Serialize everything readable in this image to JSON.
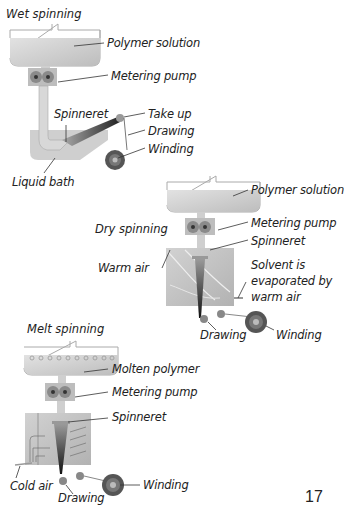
{
  "page_number": "17",
  "colors": {
    "tank_fill": "#d4d4d4",
    "chamber_fill": "#c4c4c4",
    "fiber": "#222222",
    "outline": "#9a9a9a",
    "roller": "#6a6a6a"
  },
  "wet_spinning": {
    "title": "Wet spinning",
    "labels": {
      "polymer_solution": "Polymer solution",
      "metering_pump": "Metering pump",
      "spinneret": "Spinneret",
      "take_up": "Take up",
      "drawing": "Drawing",
      "winding": "Winding",
      "liquid_bath": "Liquid bath"
    }
  },
  "dry_spinning": {
    "title": "Dry spinning",
    "labels": {
      "polymer_solution": "Polymer solution",
      "metering_pump": "Metering pump",
      "spinneret": "Spinneret",
      "warm_air": "Warm air",
      "solvent_line1": "Solvent is",
      "solvent_line2": "evaporated by",
      "solvent_line3": "warm air",
      "drawing": "Drawing",
      "winding": "Winding"
    }
  },
  "melt_spinning": {
    "title": "Melt spinning",
    "labels": {
      "molten_polymer": "Molten polymer",
      "metering_pump": "Metering pump",
      "spinneret": "Spinneret",
      "cold_air": "Cold air",
      "drawing": "Drawing",
      "winding": "Winding"
    }
  }
}
